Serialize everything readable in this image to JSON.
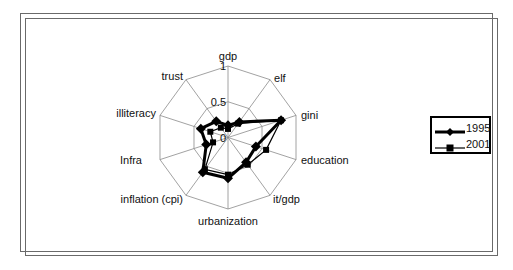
{
  "chart_data": {
    "type": "radar",
    "title": "",
    "axes": [
      "gdp",
      "elf",
      "gini",
      "education",
      "it/gdp",
      "urbanization",
      "inflation (cpi)",
      "Infra",
      "illiteracy",
      "trust"
    ],
    "radial_ticks": [
      "0",
      "0.5",
      "1"
    ],
    "rlim": [
      0,
      1
    ],
    "grid": true,
    "legend_position": "right",
    "series": [
      {
        "name": "1995",
        "marker": "diamond",
        "line_width": 3,
        "values": [
          0.17,
          0.27,
          0.78,
          0.41,
          0.43,
          0.57,
          0.6,
          0.32,
          0.4,
          0.28
        ]
      },
      {
        "name": "2001",
        "marker": "square",
        "line_width": 1.2,
        "values": [
          0.12,
          0.24,
          0.78,
          0.56,
          0.47,
          0.52,
          0.55,
          0.22,
          0.26,
          0.17
        ]
      }
    ],
    "colors": {
      "line": "#000000",
      "grid": "#8a8a8a",
      "background": "#ffffff"
    }
  },
  "legend": {
    "items": [
      {
        "label": "1995"
      },
      {
        "label": "2001"
      }
    ]
  }
}
